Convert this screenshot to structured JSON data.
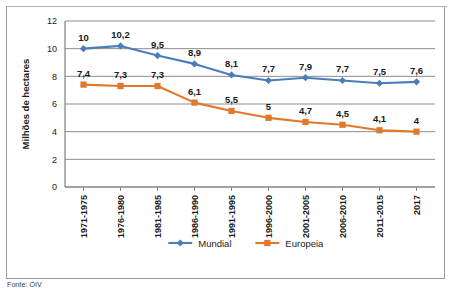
{
  "caption": "Fonte: OIV",
  "colors": {
    "mundial": "#4A7EBB",
    "europeia": "#E0782C",
    "grid": "#8d8d8d",
    "axis": "#7f7f7f",
    "frame": "#9b9b9b",
    "text": "#1a1a1a"
  },
  "legend": {
    "position": "bottom",
    "items": [
      {
        "label": "Mundial",
        "color": "#4A7EBB",
        "marker": "diamond"
      },
      {
        "label": "Europeia",
        "color": "#E0782C",
        "marker": "square"
      }
    ]
  },
  "chart_data": {
    "type": "line",
    "title": "",
    "xlabel": "",
    "ylabel": "Milhões de hectares",
    "ylim": [
      0,
      12
    ],
    "yticks": [
      0,
      2,
      4,
      6,
      8,
      10,
      12
    ],
    "ytick_labels": [
      "0",
      "2",
      "4",
      "6",
      "8",
      "10",
      "12"
    ],
    "grid": true,
    "categories": [
      "1971-1975",
      "1976-1980",
      "1981-1985",
      "1986-1990",
      "1991-1995",
      "1996-2000",
      "2001-2005",
      "2006-2010",
      "2011-2015",
      "2017"
    ],
    "series": [
      {
        "name": "Mundial",
        "color": "#4A7EBB",
        "marker": "diamond",
        "values": [
          10,
          10.2,
          9.5,
          8.9,
          8.1,
          7.7,
          7.9,
          7.7,
          7.5,
          7.6
        ],
        "labels": [
          "10",
          "10,2",
          "9,5",
          "8,9",
          "8,1",
          "7,7",
          "7,9",
          "7,7",
          "7,5",
          "7,6"
        ]
      },
      {
        "name": "Europeia",
        "color": "#E0782C",
        "marker": "square",
        "values": [
          7.4,
          7.3,
          7.3,
          6.1,
          5.5,
          5,
          4.7,
          4.5,
          4.1,
          4
        ],
        "labels": [
          "7,4",
          "7,3",
          "7,3",
          "6,1",
          "5,5",
          "5",
          "4,7",
          "4,5",
          "4,1",
          "4"
        ]
      }
    ]
  }
}
